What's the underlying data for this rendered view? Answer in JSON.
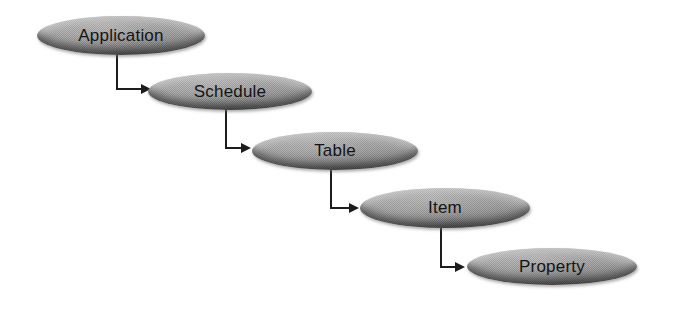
{
  "diagram": {
    "background_color": "#ffffff",
    "node_fill_color": "#9c9c9c",
    "node_highlight_color": "#b4b4b4",
    "node_shadow_color": "#5f5f5f",
    "connector_color": "#1c1c1c",
    "text_color": "#141414",
    "nodes": [
      {
        "id": "application",
        "label": "Application",
        "x": 37,
        "y": 16,
        "w": 168,
        "h": 39
      },
      {
        "id": "schedule",
        "label": "Schedule",
        "x": 148,
        "y": 73,
        "w": 164,
        "h": 37
      },
      {
        "id": "table",
        "label": "Table",
        "x": 252,
        "y": 132,
        "w": 166,
        "h": 38
      },
      {
        "id": "item",
        "label": "Item",
        "x": 360,
        "y": 188,
        "w": 170,
        "h": 40
      },
      {
        "id": "property",
        "label": "Property",
        "x": 467,
        "y": 248,
        "w": 170,
        "h": 37
      }
    ],
    "connectors": [
      {
        "from": "application",
        "to": "schedule",
        "x": 117,
        "y_start": 53,
        "y_elbow": 89,
        "x_tip": 151
      },
      {
        "from": "schedule",
        "to": "table",
        "x": 226,
        "y_start": 108,
        "y_elbow": 148,
        "x_tip": 251
      },
      {
        "from": "table",
        "to": "item",
        "x": 331,
        "y_start": 168,
        "y_elbow": 208,
        "x_tip": 359
      },
      {
        "from": "item",
        "to": "property",
        "x": 441,
        "y_start": 226,
        "y_elbow": 267,
        "x_tip": 465
      }
    ]
  }
}
